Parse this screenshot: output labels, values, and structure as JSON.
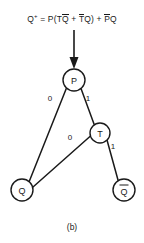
{
  "figure": {
    "equation": {
      "lhs": "Q",
      "lhs_sup": "+",
      "eq": "=",
      "p1": "P(T",
      "qbar1": "Q",
      "plus1": "+",
      "tbar": "T",
      "q1": "Q)",
      "plus2": "+",
      "pbar": "P",
      "q2": "Q"
    },
    "equation_text": "Q+ = P(TQ̄ + T̄Q) + P̄Q",
    "caption": "(b)",
    "nodes": [
      {
        "id": "P",
        "label": "P",
        "overbar": false,
        "cx": 74,
        "cy": 80,
        "r": 11
      },
      {
        "id": "T",
        "label": "T",
        "overbar": false,
        "cx": 100,
        "cy": 133,
        "r": 10
      },
      {
        "id": "Q",
        "label": "Q",
        "overbar": false,
        "cx": 22,
        "cy": 190,
        "r": 11
      },
      {
        "id": "QB",
        "label": "Q",
        "overbar": true,
        "cx": 124,
        "cy": 190,
        "r": 11
      }
    ],
    "edges": [
      {
        "from": "P",
        "to": "Q",
        "label": "0",
        "lx": 50,
        "ly": 98
      },
      {
        "from": "P",
        "to": "T",
        "label": "1",
        "lx": 88,
        "ly": 98
      },
      {
        "from": "T",
        "to": "Q",
        "label": "0",
        "lx": 70,
        "ly": 137
      },
      {
        "from": "T",
        "to": "QB",
        "label": "1",
        "lx": 113,
        "ly": 146
      }
    ],
    "input_arrow": {
      "x": 74,
      "y_start": 30,
      "y_end": 68
    },
    "colors": {
      "ink": "#1a1a1a",
      "background": "#ffffff",
      "node_fill": "#ffffff"
    }
  }
}
